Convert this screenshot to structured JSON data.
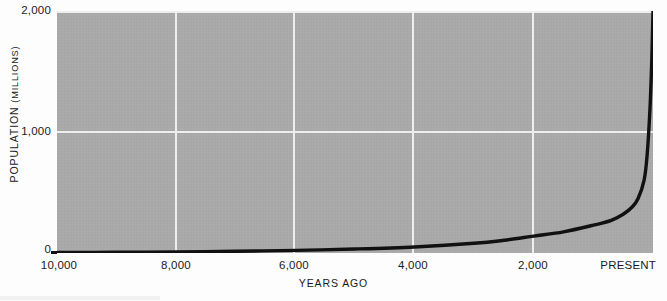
{
  "chart_data": {
    "type": "line",
    "title": "",
    "xlabel": "YEARS AGO",
    "ylabel_main": "POPULATION",
    "ylabel_unit": "(MILLIONS)",
    "ylabel_full": "POPULATION (MILLIONS)",
    "x_tick_labels": [
      "10,000",
      "8,000",
      "6,000",
      "4,000",
      "2,000",
      "PRESENT"
    ],
    "x_tick_values": [
      10000,
      8000,
      6000,
      4000,
      2000,
      0
    ],
    "y_tick_labels": [
      "2,000",
      "1,000",
      "0"
    ],
    "y_tick_values": [
      2000,
      1000,
      0
    ],
    "xlim": [
      10000,
      0
    ],
    "ylim": [
      0,
      2000
    ],
    "x_axis_direction": "reversed (years ago decreasing to present)",
    "grid": true,
    "gridline_color": "#eeeeee",
    "plot_background_color": "#a9a9a9",
    "line_color": "#111111",
    "legend": null,
    "legend_position": "none",
    "series": [
      {
        "name": "World population",
        "x": [
          10000,
          9000,
          8000,
          7000,
          6000,
          5000,
          4000,
          3000,
          2500,
          2000,
          1500,
          1000,
          700,
          500,
          350,
          250,
          150,
          100,
          50,
          20,
          0
        ],
        "values": [
          4,
          6,
          9,
          14,
          22,
          33,
          50,
          80,
          105,
          140,
          175,
          230,
          270,
          320,
          380,
          450,
          600,
          800,
          1200,
          1600,
          2000
        ]
      }
    ],
    "annotations": []
  },
  "axis_geometry": {
    "plot_left_px": 57,
    "plot_top_px": 11,
    "plot_width_px": 596,
    "plot_height_px": 242,
    "y_tick_px": [
      11,
      132,
      253
    ],
    "x_tick_px": [
      57,
      176,
      294,
      413,
      533,
      653
    ]
  }
}
